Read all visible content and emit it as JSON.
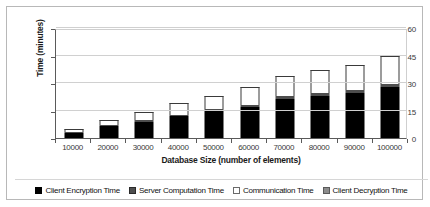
{
  "chart_data": {
    "type": "bar",
    "stacked": true,
    "title": "",
    "xlabel": "Database Size (number of elements)",
    "ylabel": "Time (minutes)",
    "categories": [
      "10000",
      "20000",
      "30000",
      "40000",
      "50000",
      "60000",
      "70000",
      "80000",
      "90000",
      "100000"
    ],
    "ylim": [
      0,
      60
    ],
    "yticks": [
      0,
      15,
      30,
      45,
      60
    ],
    "grid": true,
    "legend_position": "bottom",
    "series": [
      {
        "name": "Client Encryption Time",
        "swatch": "black",
        "color": "#000000",
        "values": [
          3.0,
          6.5,
          9.0,
          12.0,
          15.0,
          17.0,
          21.5,
          23.0,
          24.5,
          28.0
        ]
      },
      {
        "name": "Server Computation Time",
        "swatch": "dark-gray",
        "color": "#4e4e4e",
        "values": [
          0.4,
          0.5,
          0.6,
          0.8,
          1.0,
          1.2,
          1.3,
          1.4,
          1.5,
          1.6
        ]
      },
      {
        "name": "Communication Time",
        "swatch": "white",
        "color": "#ffffff",
        "values": [
          1.6,
          3.0,
          4.4,
          6.2,
          7.0,
          9.8,
          11.2,
          12.6,
          14.0,
          15.4
        ]
      },
      {
        "name": "Client Decryption Time",
        "swatch": "gray",
        "color": "#8c8c8c",
        "values": [
          0.0,
          0.0,
          0.0,
          0.0,
          0.0,
          0.0,
          0.0,
          0.0,
          0.0,
          0.0
        ]
      }
    ],
    "totals": [
      5.0,
      10.0,
      14.0,
      19.0,
      23.0,
      28.0,
      34.0,
      37.0,
      40.0,
      45.0
    ]
  }
}
